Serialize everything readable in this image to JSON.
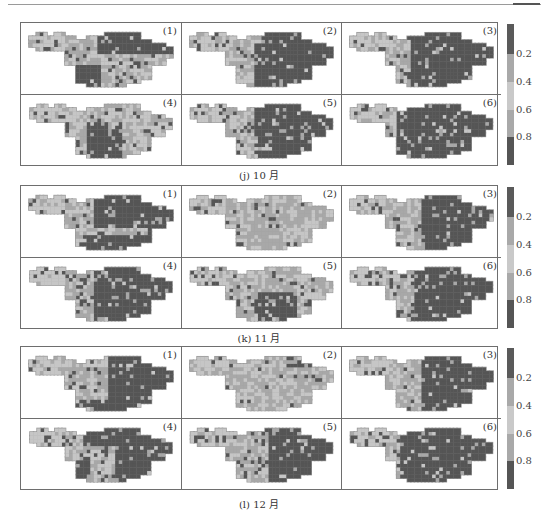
{
  "figure": {
    "groups": [
      {
        "caption": "(j) 10 月",
        "panels": [
          "(1)",
          "(2)",
          "(3)",
          "(4)",
          "(5)",
          "(6)"
        ]
      },
      {
        "caption": "(k) 11 月",
        "panels": [
          "(1)",
          "(2)",
          "(3)",
          "(4)",
          "(5)",
          "(6)"
        ]
      },
      {
        "caption": "(l) 12 月",
        "panels": [
          "(1)",
          "(2)",
          "(3)",
          "(4)",
          "(5)",
          "(6)"
        ]
      }
    ],
    "colorbar": {
      "ticks": [
        "0.2",
        "0.4",
        "0.6",
        "0.8"
      ],
      "bands": [
        "#5a5a5a",
        "#a9a9a9",
        "#c9c9c9",
        "#a9a9a9",
        "#555555"
      ]
    },
    "colors": {
      "dark": "#555555",
      "mid": "#a8a8a8",
      "light": "#c6c6c6",
      "outline": "#9a9a9a"
    }
  },
  "chart_data": {
    "type": "heatmap",
    "title": "",
    "layout": "3 groups (months) × 2 rows × 3 columns of gridded basin maps, shared discrete colorbar",
    "groups": [
      "(j) 10 月",
      "(k) 11 月",
      "(l) 12 月"
    ],
    "panel_labels": [
      "(1)",
      "(2)",
      "(3)",
      "(4)",
      "(5)",
      "(6)"
    ],
    "colorbar": {
      "ticks": [
        0.2,
        0.4,
        0.6,
        0.8
      ],
      "range": [
        0,
        1
      ],
      "levels": [
        {
          "range": [
            0.0,
            0.2
          ],
          "color": "#5a5a5a"
        },
        {
          "range": [
            0.2,
            0.4
          ],
          "color": "#a9a9a9"
        },
        {
          "range": [
            0.4,
            0.6
          ],
          "color": "#c9c9c9"
        },
        {
          "range": [
            0.6,
            0.8
          ],
          "color": "#a9a9a9"
        },
        {
          "range": [
            0.8,
            1.0
          ],
          "color": "#555555"
        }
      ]
    },
    "dominant_pattern": {
      "10月": {
        "(1)": "east dark, central-south light",
        "(2)": "east/south dark",
        "(3)": "mostly dark east",
        "(4)": "mostly light, dark center",
        "(5)": "east dark",
        "(6)": "mostly dark"
      },
      "11月": {
        "(1)": "east dark",
        "(2)": "mostly light",
        "(3)": "east dark",
        "(4)": "east dark",
        "(5)": "mostly light, dark patches",
        "(6)": "east dark"
      },
      "12月": {
        "(1)": "east dark",
        "(2)": "mostly light",
        "(3)": "east dark",
        "(4)": "east and southwest dark",
        "(5)": "east dark",
        "(6)": "mostly dark"
      }
    },
    "xlabel": "",
    "ylabel": "",
    "grid": false,
    "legend_position": "right"
  }
}
